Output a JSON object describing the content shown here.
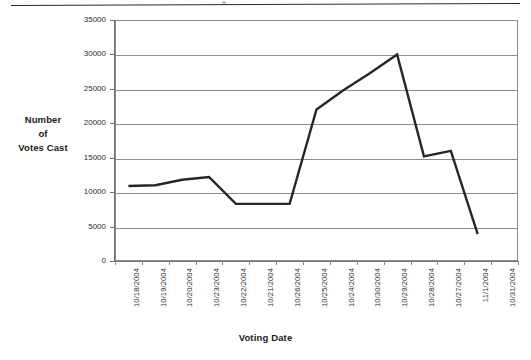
{
  "chart_data": {
    "type": "line",
    "title": "",
    "xlabel": "Voting Date",
    "ylabel_lines": [
      "Number",
      "of",
      "Votes Cast"
    ],
    "categories": [
      "10/18/2004",
      "10/19/2004",
      "10/20/2004",
      "10/23/2004",
      "10/22/2004",
      "10/21/2004",
      "10/26/2004",
      "10/25/2004",
      "10/24/2004",
      "10/30/2004",
      "10/29/2004",
      "10/28/2004",
      "10/27/2004",
      "11/1/2004",
      "10/31/2004"
    ],
    "values": [
      10900,
      11000,
      11800,
      12200,
      8300,
      8300,
      8300,
      22000,
      24800,
      27300,
      30000,
      15200,
      16000,
      3900,
      null
    ],
    "ylim": [
      0,
      35000
    ],
    "ytick_labels": [
      "35000",
      "30000",
      "25000",
      "20000",
      "15000",
      "10000",
      "5000",
      "0"
    ],
    "ytick_values": [
      35000,
      30000,
      25000,
      20000,
      15000,
      10000,
      5000,
      0
    ],
    "grid": true,
    "legend": false,
    "series_color": "#262626",
    "grid_color": "#8d8d8d",
    "axis_color": "#6e6e6e"
  }
}
